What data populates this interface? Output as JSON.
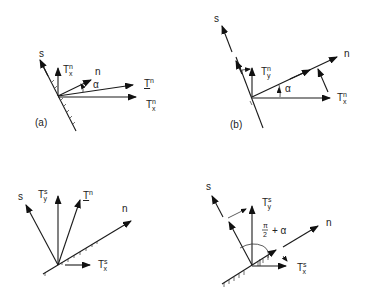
{
  "figure": {
    "panels": [
      {
        "id": "a",
        "label": "(a)",
        "vectors": [
          {
            "name": "s",
            "label": "s"
          },
          {
            "name": "Tn_x_vertical",
            "label": "T",
            "sup": "n",
            "sub": "x"
          },
          {
            "name": "n",
            "label": "n"
          },
          {
            "name": "angle",
            "label": "α"
          },
          {
            "name": "Tn",
            "label": "T",
            "sup": "n"
          },
          {
            "name": "Tn_x",
            "label": "T",
            "sup": "n",
            "sub": "x"
          }
        ]
      },
      {
        "id": "b",
        "label": "(b)",
        "vectors": [
          {
            "name": "s",
            "label": "s"
          },
          {
            "name": "Tn_y",
            "label": "T",
            "sup": "n",
            "sub": "y"
          },
          {
            "name": "n",
            "label": "n"
          },
          {
            "name": "angle",
            "label": "α"
          },
          {
            "name": "Tn_x",
            "label": "T",
            "sup": "n",
            "sub": "x"
          }
        ]
      },
      {
        "id": "c",
        "label": "",
        "vectors": [
          {
            "name": "s",
            "label": "s"
          },
          {
            "name": "Ts_y",
            "label": "T",
            "sup": "s",
            "sub": "y"
          },
          {
            "name": "Tn",
            "label": "T",
            "sup": "n"
          },
          {
            "name": "n",
            "label": "n"
          },
          {
            "name": "Ts_x",
            "label": "T",
            "sup": "s",
            "sub": "x"
          }
        ]
      },
      {
        "id": "d",
        "label": "",
        "vectors": [
          {
            "name": "s",
            "label": "s"
          },
          {
            "name": "Ts_y",
            "label": "T",
            "sup": "s",
            "sub": "y"
          },
          {
            "name": "n",
            "label": "n"
          },
          {
            "name": "angle",
            "label_num": "π",
            "label_den": "2",
            "label_rest": "+ α"
          },
          {
            "name": "Ts_x",
            "label": "T",
            "sup": "s",
            "sub": "x"
          }
        ]
      }
    ]
  }
}
